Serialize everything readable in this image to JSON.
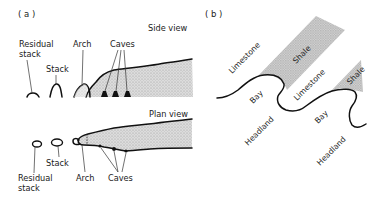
{
  "figure": {
    "panel_a": {
      "label": "( a )",
      "side_view": {
        "title": "Side view",
        "labels": {
          "residual_stack_1": "Residual",
          "residual_stack_2": "stack",
          "stack": "Stack",
          "arch": "Arch",
          "caves": "Caves"
        }
      },
      "plan_view": {
        "title": "Plan view",
        "labels": {
          "stack": "Stack",
          "residual_stack_1": "Residual",
          "residual_stack_2": "stack",
          "arch": "Arch",
          "caves": "Caves"
        }
      }
    },
    "panel_b": {
      "label": "( b )",
      "labels": {
        "limestone_upper": "Limestone",
        "shale_upper": "Shale",
        "bay_upper": "Bay",
        "limestone_middle": "Limestone",
        "shale_lower": "Shale",
        "headland_upper": "Headland",
        "bay_lower": "Bay",
        "headland_lower": "Headland"
      }
    },
    "colors": {
      "rock_fill": "#d4d4d4",
      "shale_fill": "#cfcfcf",
      "line": "#111111"
    }
  }
}
